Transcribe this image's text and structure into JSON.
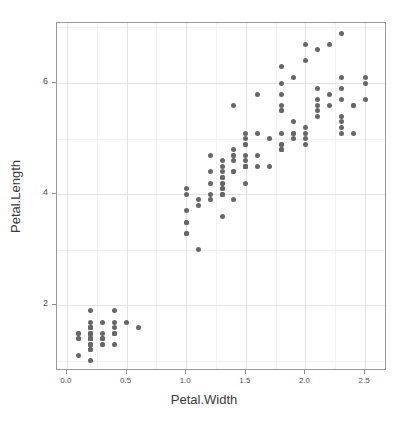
{
  "chart_data": {
    "type": "scatter",
    "title": "",
    "xlabel": "Petal.Width",
    "ylabel": "Petal.Length",
    "xlim": [
      -0.0833,
      2.6833
    ],
    "ylim": [
      0.82,
      7.08
    ],
    "xticks": [
      0.0,
      0.5,
      1.0,
      1.5,
      2.0,
      2.5
    ],
    "xticklabels": [
      "0.0",
      "0.5",
      "1.0",
      "1.5",
      "2.0",
      "2.5"
    ],
    "yticks": [
      2,
      4,
      6
    ],
    "yticklabels": [
      "2",
      "4",
      "6"
    ],
    "xminor": [
      0.25,
      0.75,
      1.25,
      1.75,
      2.25
    ],
    "yminor": [
      1,
      3,
      5,
      7
    ],
    "grid": true,
    "legend": "none",
    "point_color": "#676767",
    "point_size": 5,
    "panel_background": "#ffffff",
    "panel_border": "#9a9a9a",
    "grid_major_color": "#e2e2e2",
    "grid_minor_color": "#f1f1f1",
    "series": [
      {
        "name": "iris",
        "x": [
          0.2,
          0.2,
          0.2,
          0.2,
          0.2,
          0.4,
          0.3,
          0.2,
          0.2,
          0.1,
          0.2,
          0.2,
          0.1,
          0.1,
          0.2,
          0.4,
          0.4,
          0.3,
          0.3,
          0.3,
          0.2,
          0.4,
          0.2,
          0.5,
          0.2,
          0.2,
          0.4,
          0.2,
          0.2,
          0.2,
          0.2,
          0.4,
          0.1,
          0.2,
          0.2,
          0.2,
          0.2,
          0.1,
          0.2,
          0.2,
          0.3,
          0.3,
          0.2,
          0.6,
          0.4,
          0.3,
          0.2,
          0.2,
          0.2,
          0.2,
          1.4,
          1.5,
          1.5,
          1.3,
          1.5,
          1.3,
          1.6,
          1.0,
          1.3,
          1.4,
          1.0,
          1.5,
          1.0,
          1.4,
          1.3,
          1.4,
          1.5,
          1.0,
          1.5,
          1.1,
          1.8,
          1.3,
          1.5,
          1.2,
          1.3,
          1.4,
          1.4,
          1.7,
          1.5,
          1.0,
          1.1,
          1.0,
          1.2,
          1.6,
          1.5,
          1.6,
          1.5,
          1.3,
          1.3,
          1.3,
          1.2,
          1.4,
          1.2,
          1.0,
          1.3,
          1.2,
          1.3,
          1.3,
          1.1,
          1.3,
          2.5,
          1.9,
          2.1,
          1.8,
          2.2,
          2.1,
          1.7,
          1.8,
          1.8,
          2.5,
          2.0,
          1.9,
          2.1,
          2.0,
          2.4,
          2.3,
          1.8,
          2.2,
          2.3,
          1.5,
          2.3,
          2.0,
          2.0,
          1.8,
          2.1,
          1.8,
          1.8,
          1.8,
          2.1,
          1.6,
          1.9,
          2.0,
          2.2,
          1.5,
          1.4,
          2.3,
          2.4,
          1.8,
          1.8,
          2.1,
          2.4,
          2.3,
          1.9,
          2.3,
          2.5,
          2.3,
          1.9,
          2.0,
          2.3,
          1.8
        ],
        "y": [
          1.4,
          1.4,
          1.3,
          1.5,
          1.4,
          1.7,
          1.4,
          1.5,
          1.4,
          1.5,
          1.5,
          1.6,
          1.4,
          1.1,
          1.2,
          1.5,
          1.3,
          1.4,
          1.7,
          1.5,
          1.7,
          1.5,
          1.0,
          1.7,
          1.9,
          1.6,
          1.6,
          1.5,
          1.4,
          1.6,
          1.6,
          1.5,
          1.5,
          1.4,
          1.5,
          1.2,
          1.3,
          1.4,
          1.3,
          1.5,
          1.3,
          1.3,
          1.3,
          1.6,
          1.9,
          1.4,
          1.6,
          1.4,
          1.5,
          1.4,
          4.7,
          4.5,
          4.9,
          4.0,
          4.6,
          4.5,
          4.7,
          3.3,
          4.6,
          3.9,
          3.5,
          4.2,
          4.0,
          4.7,
          3.6,
          4.4,
          4.5,
          4.1,
          4.5,
          3.9,
          4.8,
          4.0,
          4.9,
          4.7,
          4.3,
          4.4,
          4.8,
          5.0,
          4.5,
          3.5,
          3.8,
          3.7,
          3.9,
          5.1,
          4.5,
          4.5,
          4.7,
          4.4,
          4.1,
          4.0,
          4.4,
          4.6,
          4.0,
          3.3,
          4.2,
          4.2,
          4.2,
          4.3,
          3.0,
          4.1,
          6.0,
          5.1,
          5.9,
          5.6,
          5.8,
          6.6,
          4.5,
          6.3,
          5.8,
          6.1,
          5.1,
          5.3,
          5.5,
          5.0,
          5.1,
          5.3,
          5.5,
          6.7,
          6.9,
          5.0,
          5.7,
          4.9,
          6.7,
          4.9,
          5.7,
          6.0,
          4.8,
          4.9,
          5.6,
          5.8,
          6.1,
          6.4,
          5.6,
          5.1,
          5.6,
          6.1,
          5.6,
          5.5,
          4.8,
          5.4,
          5.6,
          5.1,
          5.1,
          5.9,
          5.7,
          5.2,
          5.0,
          5.2,
          5.4,
          5.1
        ]
      }
    ]
  },
  "axes": {
    "x_title": "Petal.Width",
    "y_title": "Petal.Length"
  }
}
